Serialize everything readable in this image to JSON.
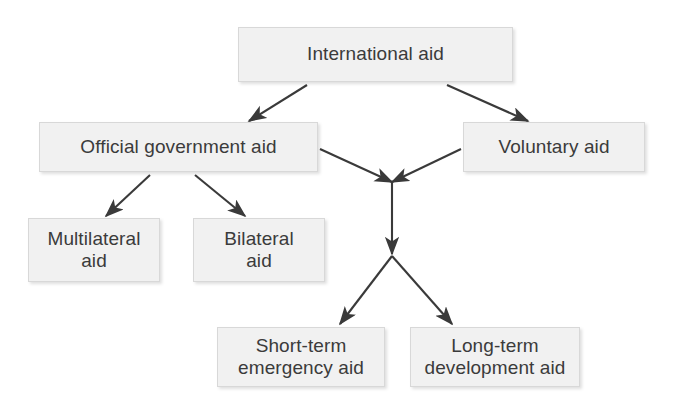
{
  "diagram": {
    "type": "flowchart",
    "title": "International aid",
    "background_color": "#ffffff",
    "node_fill_color": "#f1f1f1",
    "node_border_color": "#d8d8d8",
    "text_color": "#3b3b3b",
    "arrow_color": "#3a3a3a",
    "nodes": [
      {
        "id": "international-aid",
        "label": "International aid",
        "x": 238,
        "y": 27,
        "width": 275,
        "height": 55
      },
      {
        "id": "official-government-aid",
        "label": "Official government aid",
        "x": 39,
        "y": 122,
        "width": 279,
        "height": 50
      },
      {
        "id": "voluntary-aid",
        "label": "Voluntary aid",
        "x": 463,
        "y": 122,
        "width": 182,
        "height": 50
      },
      {
        "id": "multilateral-aid",
        "label": "Multilateral\naid",
        "x": 28,
        "y": 218,
        "width": 132,
        "height": 64
      },
      {
        "id": "bilateral-aid",
        "label": "Bilateral\naid",
        "x": 193,
        "y": 218,
        "width": 132,
        "height": 64
      },
      {
        "id": "short-term-emergency-aid",
        "label": "Short-term\nemergency aid",
        "x": 217,
        "y": 327,
        "width": 168,
        "height": 60
      },
      {
        "id": "long-term-development-aid",
        "label": "Long-term\ndevelopment aid",
        "x": 410,
        "y": 327,
        "width": 170,
        "height": 60
      }
    ],
    "junctions": [
      {
        "id": "upper-junction",
        "x": 392,
        "y": 182
      },
      {
        "id": "lower-junction",
        "x": 392,
        "y": 256
      }
    ],
    "edges": [
      {
        "id": "intl-to-official",
        "from": "international-aid",
        "to": "official-government-aid"
      },
      {
        "id": "intl-to-voluntary",
        "from": "international-aid",
        "to": "voluntary-aid"
      },
      {
        "id": "official-to-multilateral",
        "from": "official-government-aid",
        "to": "multilateral-aid"
      },
      {
        "id": "official-to-bilateral",
        "from": "official-government-aid",
        "to": "bilateral-aid"
      },
      {
        "id": "official-to-junction",
        "from": "official-government-aid",
        "to": "upper-junction"
      },
      {
        "id": "voluntary-to-junction",
        "from": "voluntary-aid",
        "to": "upper-junction"
      },
      {
        "id": "junction-to-lower",
        "from": "upper-junction",
        "to": "lower-junction"
      },
      {
        "id": "lower-to-short-term",
        "from": "lower-junction",
        "to": "short-term-emergency-aid"
      },
      {
        "id": "lower-to-long-term",
        "from": "lower-junction",
        "to": "long-term-development-aid"
      }
    ]
  }
}
